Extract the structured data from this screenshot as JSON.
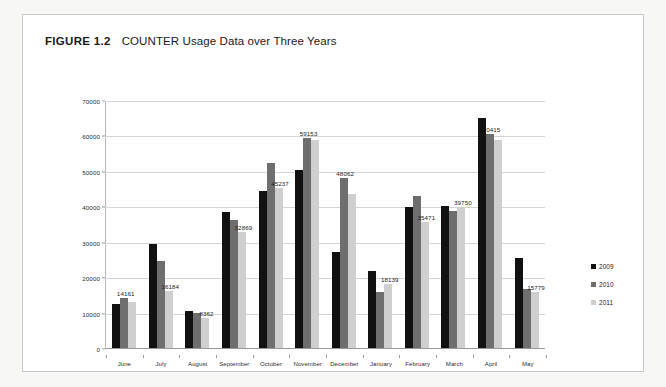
{
  "figure": {
    "label": "FIGURE 1.2",
    "title": "COUNTER Usage Data over Three Years"
  },
  "legend": {
    "position": "right",
    "items": [
      {
        "name": "2009",
        "color": "#111111"
      },
      {
        "name": "2010",
        "color": "#6e6e6e"
      },
      {
        "name": "2011",
        "color": "#cfcfcf"
      }
    ]
  },
  "chart_data": {
    "type": "bar",
    "title": "COUNTER Usage Data over Three Years",
    "xlabel": "",
    "ylabel": "",
    "ylim": [
      0,
      70000
    ],
    "yticks": [
      0,
      10000,
      20000,
      30000,
      40000,
      50000,
      60000,
      70000
    ],
    "grid": true,
    "legend_position": "right",
    "categories": [
      "June",
      "July",
      "August",
      "September",
      "October",
      "November",
      "December",
      "January",
      "February",
      "March",
      "April",
      "May"
    ],
    "series": [
      {
        "name": "2009",
        "color": "#111111",
        "values": [
          12300,
          29500,
          10500,
          38500,
          44400,
          50300,
          27000,
          21800,
          39900,
          40000,
          65000,
          25500
        ]
      },
      {
        "name": "2010",
        "color": "#6e6e6e",
        "values": [
          14161,
          24700,
          9800,
          36200,
          52200,
          59153,
          48062,
          15800,
          42800,
          38800,
          60415,
          16700
        ]
      },
      {
        "name": "2011",
        "color": "#cfcfcf",
        "values": [
          13000,
          16184,
          8362,
          32869,
          45237,
          58800,
          43500,
          18139,
          35471,
          39750,
          58800,
          15779
        ]
      }
    ],
    "point_labels": [
      {
        "category": "June",
        "series": "2010",
        "text": "14161"
      },
      {
        "category": "July",
        "series": "2011",
        "text": "16184"
      },
      {
        "category": "August",
        "series": "2011",
        "text": "8362"
      },
      {
        "category": "September",
        "series": "2011",
        "text": "32869"
      },
      {
        "category": "October",
        "series": "2011",
        "text": "45237"
      },
      {
        "category": "November",
        "series": "2010",
        "text": "59153"
      },
      {
        "category": "December",
        "series": "2010",
        "text": "48062"
      },
      {
        "category": "January",
        "series": "2011",
        "text": "18139"
      },
      {
        "category": "February",
        "series": "2011",
        "text": "35471"
      },
      {
        "category": "March",
        "series": "2011",
        "text": "39750"
      },
      {
        "category": "April",
        "series": "2010",
        "text": "60415"
      },
      {
        "category": "May",
        "series": "2011",
        "text": "15779"
      }
    ]
  }
}
